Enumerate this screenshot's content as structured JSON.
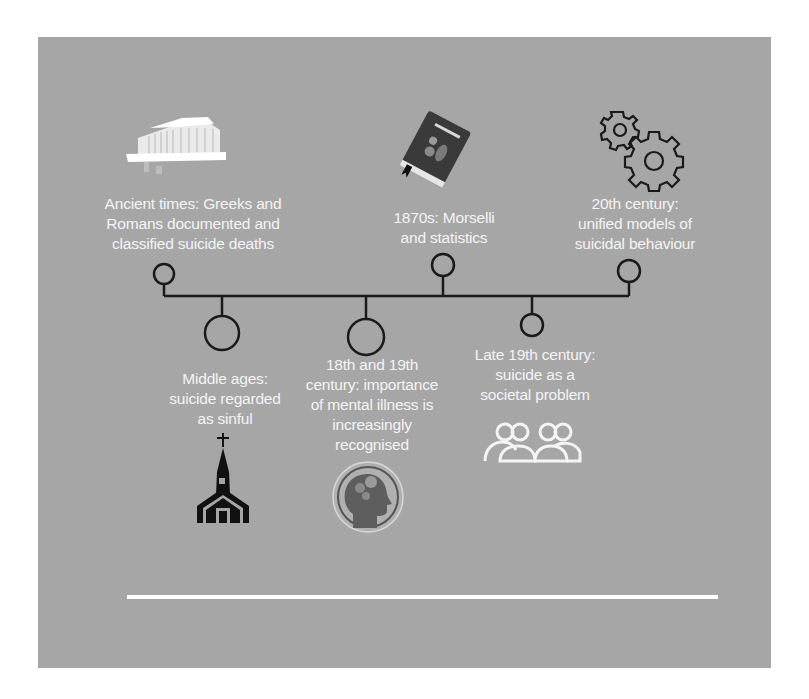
{
  "diagram": {
    "type": "timeline",
    "colors": {
      "background": "#a6a6a6",
      "page": "#ffffff",
      "line": "#1a1a1a",
      "text": "#f4f4f4",
      "footer_rule": "#ffffff"
    },
    "events": [
      {
        "id": "ancient",
        "position": "above",
        "icon": "greek-temple-icon",
        "lines": [
          "Ancient times: Greeks and",
          "Romans documented and",
          "classified suicide deaths"
        ]
      },
      {
        "id": "middle-ages",
        "position": "below",
        "icon": "church-icon",
        "lines": [
          "Middle ages:",
          "suicide regarded",
          "as sinful"
        ]
      },
      {
        "id": "18th-19th",
        "position": "below",
        "icon": "head-gears-icon",
        "lines": [
          "18th and 19th",
          "century: importance",
          "of mental illness is",
          "increasingly",
          "recognised"
        ]
      },
      {
        "id": "1870s",
        "position": "above",
        "icon": "book-icon",
        "lines": [
          "1870s: Morselli",
          "and statistics"
        ]
      },
      {
        "id": "late-19th",
        "position": "below",
        "icon": "people-group-icon",
        "lines": [
          "Late 19th century:",
          "suicide as a",
          "societal problem"
        ]
      },
      {
        "id": "20th",
        "position": "above",
        "icon": "gears-icon",
        "lines": [
          "20th century:",
          "unified models of",
          "suicidal behaviour"
        ]
      }
    ]
  }
}
